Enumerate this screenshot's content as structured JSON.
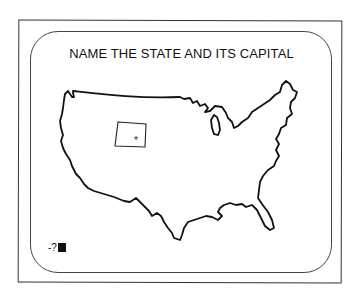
{
  "screen": {
    "title": "NAME THE STATE AND ITS CAPITAL",
    "highlighted_state": {
      "shape": "rectangle",
      "capital_marker": "*"
    },
    "prompt": {
      "text": "-?",
      "cursor": "block"
    }
  },
  "colors": {
    "background": "#ffffff",
    "ink": "#111111"
  }
}
